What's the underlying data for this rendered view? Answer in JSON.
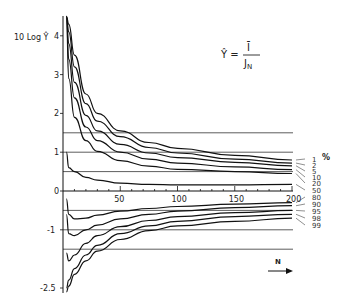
{
  "chart_data": {
    "type": "line",
    "title": "",
    "formula": "Ŷ = Ī / J_N",
    "formula_lhs": "Ŷ =",
    "formula_num": "Ī",
    "formula_den": "J",
    "formula_den_sub": "N",
    "xlabel": "N",
    "ylabel": "10 Log Ŷ",
    "xlim": [
      0,
      200
    ],
    "ylim": [
      -2.5,
      4.5
    ],
    "xticks": [
      "50",
      "100",
      "150",
      "200"
    ],
    "yticks": [
      "4",
      "3",
      "2",
      "1",
      "0",
      "-1",
      "-2.5"
    ],
    "reference_lines_y": [
      1.5,
      1.0,
      0.5,
      -0.5,
      -1.0,
      -1.5
    ],
    "legend_unit": "%",
    "x": [
      3,
      5,
      10,
      20,
      30,
      50,
      75,
      100,
      150,
      200
    ],
    "series": [
      {
        "name": "1",
        "values": [
          4.5,
          4.3,
          3.5,
          2.5,
          2.0,
          1.55,
          1.25,
          1.1,
          0.92,
          0.8
        ]
      },
      {
        "name": "2",
        "values": [
          4.5,
          4.1,
          3.2,
          2.25,
          1.8,
          1.4,
          1.12,
          0.98,
          0.82,
          0.72
        ]
      },
      {
        "name": "5",
        "values": [
          4.5,
          3.8,
          2.8,
          1.95,
          1.55,
          1.2,
          0.98,
          0.86,
          0.74,
          0.65
        ]
      },
      {
        "name": "10",
        "values": [
          4.5,
          3.4,
          2.4,
          1.65,
          1.3,
          1.0,
          0.82,
          0.72,
          0.62,
          0.55
        ]
      },
      {
        "name": "20",
        "values": [
          4.5,
          2.9,
          1.9,
          1.3,
          1.02,
          0.78,
          0.64,
          0.56,
          0.5,
          0.45
        ]
      },
      {
        "name": "50",
        "values": [
          1.0,
          0.6,
          0.5,
          0.35,
          0.28,
          0.2,
          0.17,
          0.16,
          0.16,
          0.17
        ]
      },
      {
        "name": "80",
        "values": [
          -0.2,
          -0.6,
          -0.72,
          -0.7,
          -0.62,
          -0.52,
          -0.45,
          -0.4,
          -0.34,
          -0.3
        ]
      },
      {
        "name": "90",
        "values": [
          -0.6,
          -1.1,
          -1.15,
          -1.0,
          -0.88,
          -0.72,
          -0.6,
          -0.52,
          -0.43,
          -0.38
        ]
      },
      {
        "name": "95",
        "values": [
          -1.6,
          -1.8,
          -1.65,
          -1.35,
          -1.15,
          -0.92,
          -0.76,
          -0.66,
          -0.56,
          -0.5
        ]
      },
      {
        "name": "98",
        "values": [
          -2.5,
          -2.3,
          -2.0,
          -1.65,
          -1.4,
          -1.1,
          -0.9,
          -0.78,
          -0.66,
          -0.6
        ]
      },
      {
        "name": "99",
        "values": [
          -2.6,
          -2.45,
          -2.15,
          -1.8,
          -1.55,
          -1.25,
          -1.02,
          -0.9,
          -0.78,
          -0.7
        ]
      }
    ]
  }
}
